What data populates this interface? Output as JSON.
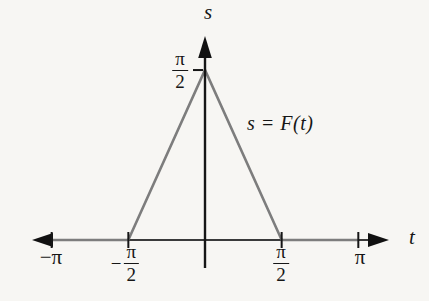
{
  "figure": {
    "background_color": "#f7f6f3",
    "axis_color": "#2e2e2e",
    "curve_color": "#7d7d7d",
    "s_axis_label": "s",
    "t_axis_label": "t",
    "curve_annotation": "s = F(t)",
    "labels": {
      "minus": "−",
      "pi": "π",
      "two": "2",
      "neg_pi": "−π"
    }
  },
  "chart_data": {
    "type": "line",
    "title": "",
    "xlabel": "t",
    "ylabel": "s",
    "series": [
      {
        "name": "s = F(t)",
        "x": [
          -3.1416,
          -1.5708,
          0,
          1.5708,
          3.1416
        ],
        "y": [
          0,
          0,
          1.5708,
          0,
          0
        ]
      }
    ],
    "x_ticks": [
      {
        "value": -3.1416,
        "label": "−π"
      },
      {
        "value": -1.5708,
        "label": "−π/2"
      },
      {
        "value": 1.5708,
        "label": "π/2"
      },
      {
        "value": 3.1416,
        "label": "π"
      }
    ],
    "y_ticks": [
      {
        "value": 1.5708,
        "label": "π/2"
      }
    ],
    "xlim": [
      -3.7,
      3.9
    ],
    "ylim": [
      0,
      1.9
    ],
    "grid": false,
    "legend": null,
    "annotation": {
      "text": "s = F(t)",
      "x": 0.88,
      "y": 1.06
    }
  }
}
